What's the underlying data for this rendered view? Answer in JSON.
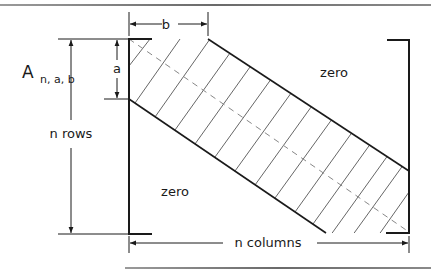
{
  "diagram": {
    "matrix_name": "A",
    "matrix_subscript": "n, a, b",
    "labels": {
      "b": "b",
      "a": "a",
      "rows": "n rows",
      "columns": "n columns",
      "zero_upper": "zero",
      "zero_lower": "zero"
    },
    "colors": {
      "ink": "#1a1a1a",
      "hatch": "#555555",
      "dash": "#888888",
      "frame": "#7a7a7a"
    }
  }
}
